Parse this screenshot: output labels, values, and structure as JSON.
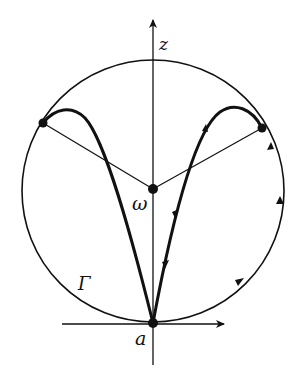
{
  "diagram": {
    "title": "",
    "colors": {
      "ink": "#111111",
      "background": "#ffffff"
    },
    "labels": {
      "z_axis": "z",
      "center": "ω",
      "circle": "Γ",
      "origin": "a"
    },
    "elements": {
      "circle": {
        "name": "Γ",
        "center": [
          153,
          191
        ],
        "radius": 131
      },
      "points": [
        {
          "name": "a",
          "pos": [
            153,
            323
          ]
        },
        {
          "name": "ω",
          "pos": [
            153,
            189
          ]
        },
        {
          "name": "left-contact",
          "pos": [
            43,
            123
          ]
        },
        {
          "name": "right-contact",
          "pos": [
            262,
            128
          ]
        }
      ],
      "axes": [
        {
          "name": "z",
          "direction": "up"
        },
        {
          "name": "horizontal",
          "direction": "right"
        }
      ],
      "orbits": [
        "left-loop",
        "right-loop"
      ],
      "arrows_on_curves": 4,
      "arrows_on_circle": 2
    }
  }
}
